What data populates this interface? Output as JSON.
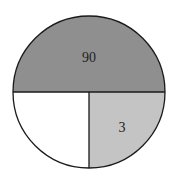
{
  "diagram": {
    "type": "circle-partition",
    "circle": {
      "cx": 89,
      "cy": 92,
      "r": 76
    },
    "regions": [
      {
        "name": "top-half",
        "label": "90",
        "fill": "#8f8f8f",
        "label_x": 89,
        "label_y": 62
      },
      {
        "name": "bottom-right-quarter",
        "label": "3",
        "fill": "#c4c4c4",
        "label_x": 122,
        "label_y": 132
      },
      {
        "name": "bottom-left-quarter",
        "label": "",
        "fill": "#ffffff"
      }
    ],
    "stroke": "#1a1a1a"
  }
}
